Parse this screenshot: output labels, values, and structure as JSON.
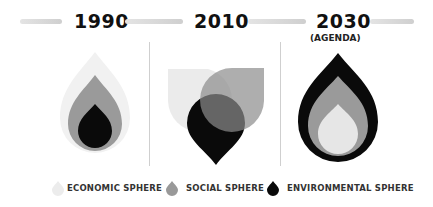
{
  "timeline": [
    {
      "year": "1990",
      "subtitle": ""
    },
    {
      "year": "2010",
      "subtitle": ""
    },
    {
      "year": "2030",
      "subtitle": "(AGENDA)"
    }
  ],
  "legend": [
    {
      "label": "ECONOMIC SPHERE",
      "color": "#ececec"
    },
    {
      "label": "SOCIAL SPHERE",
      "color": "#999999"
    },
    {
      "label": "ENVIRONMENTAL SPHERE",
      "color": "#0a0a0a"
    }
  ],
  "colors": {
    "economic": "#ececec",
    "social": "#999999",
    "environmental": "#0a0a0a",
    "divider": "#cfcfcf"
  }
}
